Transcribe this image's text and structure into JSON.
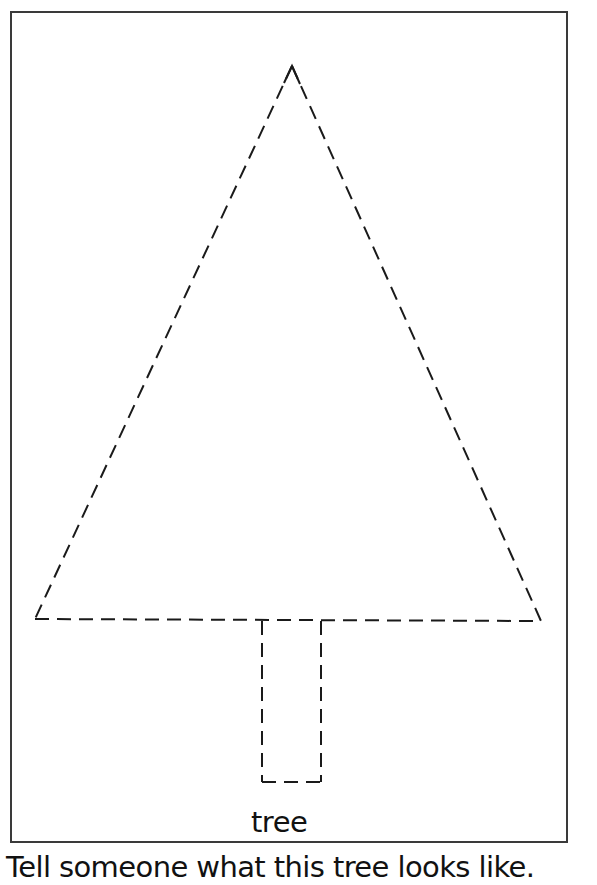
{
  "worksheet": {
    "label": "tree",
    "instruction": "Tell someone what this tree looks like.",
    "shape": {
      "name": "dashed-tree-outline",
      "stroke_color": "#1a1a1a",
      "dash_pattern": "14 8",
      "canopy_triangle": {
        "apex": [
          292,
          66
        ],
        "bottom_left": [
          35,
          619
        ],
        "bottom_right": [
          541,
          621
        ]
      },
      "trunk_rect": {
        "left": 262,
        "right": 321,
        "top": 620,
        "bottom": 782
      }
    },
    "frame_color": "#3a3a3a"
  }
}
